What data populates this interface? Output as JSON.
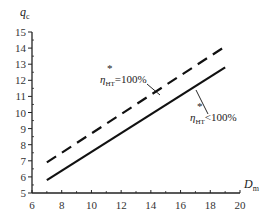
{
  "chart_data": {
    "type": "line",
    "title": "",
    "xlabel": "D_m",
    "ylabel": "q_c",
    "xlim": [
      6,
      20
    ],
    "ylim": [
      5,
      15
    ],
    "xticks": [
      6,
      8,
      10,
      12,
      14,
      16,
      18,
      20
    ],
    "yticks": [
      5,
      6,
      7,
      8,
      9,
      10,
      11,
      12,
      13,
      14,
      15
    ],
    "grid": false,
    "legend": "none (inline annotations)",
    "series": [
      {
        "name": "η*HT = 100%",
        "style": "dashed",
        "x": [
          7,
          19
        ],
        "y": [
          6.9,
          14.1
        ]
      },
      {
        "name": "η*HT < 100%",
        "style": "solid",
        "x": [
          7,
          19
        ],
        "y": [
          5.8,
          12.8
        ]
      }
    ],
    "annotations": [
      {
        "text_main": "η",
        "sup": "*",
        "sub": "HT",
        "tail": "=100%",
        "target_series": 0
      },
      {
        "text_main": "η",
        "sup": "*",
        "sub": "HT",
        "tail": "<100%",
        "target_series": 1
      }
    ]
  },
  "axes": {
    "y_label_main": "q",
    "y_label_sub": "c",
    "x_label_main": "D",
    "x_label_sub": "m"
  },
  "colors": {
    "line": "#111111",
    "axis": "#222222",
    "background": "#ffffff"
  }
}
